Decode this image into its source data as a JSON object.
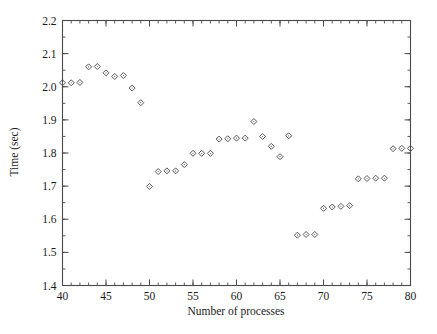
{
  "chart_data": {
    "type": "scatter",
    "title": "",
    "xlabel": "Number of processes",
    "ylabel": "Time (sec)",
    "xlim": [
      40,
      80
    ],
    "ylim": [
      1.4,
      2.2
    ],
    "xticks": [
      40,
      45,
      50,
      55,
      60,
      65,
      70,
      75,
      80
    ],
    "xticklabels": [
      "40",
      "45",
      "50",
      "55",
      "60",
      "65",
      "70",
      "75",
      "80"
    ],
    "yticks": [
      1.4,
      1.5,
      1.6,
      1.7,
      1.8,
      1.9,
      2.0,
      2.1,
      2.2
    ],
    "yticklabels": [
      "1.4",
      "1.5",
      "1.6",
      "1.7",
      "1.8",
      "1.9",
      "2.0",
      "2.1",
      "2.2"
    ],
    "xtick_minor_step": 1,
    "ytick_minor_step": 0.05,
    "grid": false,
    "legend": false,
    "legend_position": "none",
    "marker": "open-diamond",
    "marker_color": "#555555",
    "frame": "box-all-sides",
    "x": [
      40,
      41,
      42,
      43,
      44,
      45,
      46,
      47,
      48,
      49,
      50,
      51,
      52,
      53,
      54,
      55,
      56,
      57,
      58,
      59,
      60,
      61,
      62,
      63,
      64,
      65,
      66,
      67,
      68,
      69,
      70,
      71,
      72,
      73,
      74,
      75,
      76,
      77,
      78,
      79,
      80
    ],
    "y": [
      2.012,
      2.012,
      2.013,
      2.06,
      2.061,
      2.042,
      2.031,
      2.034,
      1.996,
      1.952,
      1.699,
      1.744,
      1.746,
      1.746,
      1.765,
      1.799,
      1.799,
      1.799,
      1.842,
      1.843,
      1.845,
      1.845,
      1.895,
      1.85,
      1.82,
      1.789,
      1.852,
      1.552,
      1.554,
      1.554,
      1.633,
      1.637,
      1.639,
      1.641,
      1.722,
      1.723,
      1.724,
      1.724,
      1.813,
      1.814,
      1.814
    ],
    "series": [
      {
        "name": "Time vs processes",
        "points": [
          {
            "x": 40,
            "y": 2.012
          },
          {
            "x": 41,
            "y": 2.012
          },
          {
            "x": 42,
            "y": 2.013
          },
          {
            "x": 43,
            "y": 2.06
          },
          {
            "x": 44,
            "y": 2.061
          },
          {
            "x": 45,
            "y": 2.042
          },
          {
            "x": 46,
            "y": 2.031
          },
          {
            "x": 47,
            "y": 2.034
          },
          {
            "x": 48,
            "y": 1.996
          },
          {
            "x": 49,
            "y": 1.952
          },
          {
            "x": 50,
            "y": 1.699
          },
          {
            "x": 51,
            "y": 1.744
          },
          {
            "x": 52,
            "y": 1.746
          },
          {
            "x": 53,
            "y": 1.746
          },
          {
            "x": 54,
            "y": 1.765
          },
          {
            "x": 55,
            "y": 1.799
          },
          {
            "x": 56,
            "y": 1.799
          },
          {
            "x": 57,
            "y": 1.799
          },
          {
            "x": 58,
            "y": 1.842
          },
          {
            "x": 59,
            "y": 1.843
          },
          {
            "x": 60,
            "y": 1.845
          },
          {
            "x": 61,
            "y": 1.845
          },
          {
            "x": 62,
            "y": 1.895
          },
          {
            "x": 63,
            "y": 1.85
          },
          {
            "x": 64,
            "y": 1.82
          },
          {
            "x": 65,
            "y": 1.789
          },
          {
            "x": 66,
            "y": 1.852
          },
          {
            "x": 67,
            "y": 1.552
          },
          {
            "x": 68,
            "y": 1.554
          },
          {
            "x": 69,
            "y": 1.554
          },
          {
            "x": 70,
            "y": 1.633
          },
          {
            "x": 71,
            "y": 1.637
          },
          {
            "x": 72,
            "y": 1.639
          },
          {
            "x": 73,
            "y": 1.641
          },
          {
            "x": 74,
            "y": 1.722
          },
          {
            "x": 75,
            "y": 1.723
          },
          {
            "x": 76,
            "y": 1.724
          },
          {
            "x": 77,
            "y": 1.724
          },
          {
            "x": 78,
            "y": 1.813
          },
          {
            "x": 79,
            "y": 1.814
          },
          {
            "x": 80,
            "y": 1.814
          }
        ]
      }
    ]
  }
}
